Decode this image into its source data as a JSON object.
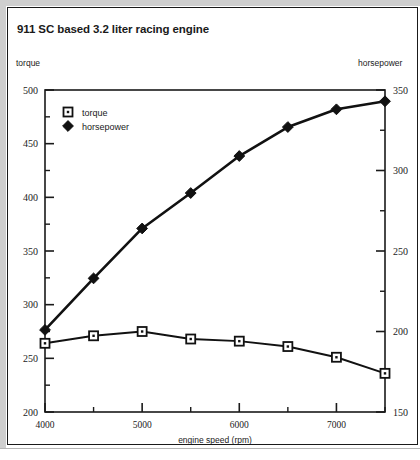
{
  "figure": {
    "title": "911 SC based 3.2 liter racing engine",
    "left_axis_caption": "torque",
    "right_axis_caption": "horsepower",
    "background": "#ffffff",
    "frame_color": "#1a1a1a",
    "line_color": "#111111"
  },
  "chart_data": {
    "type": "line",
    "title": "911 SC based 3.2 liter racing engine",
    "subtitle": "",
    "xlabel": "engine speed (rpm)",
    "ylabel": "torque",
    "y2label": "horsepower",
    "xlim": [
      4000,
      7500
    ],
    "ylim": [
      200,
      500
    ],
    "y2lim": [
      150,
      350
    ],
    "xticks": [
      4000,
      5000,
      6000,
      7000
    ],
    "xticklabels": [
      "4000",
      "5000",
      "6000",
      "7000"
    ],
    "xminorticks": [
      4500,
      5500,
      6500,
      7500
    ],
    "yticks": [
      200,
      250,
      300,
      350,
      400,
      450,
      500
    ],
    "yticklabels": [
      "200",
      "250",
      "300",
      "350",
      "400",
      "450",
      "500"
    ],
    "yminorticks": [
      225,
      275,
      325,
      375,
      425,
      475
    ],
    "y2ticks": [
      150,
      200,
      250,
      300,
      350
    ],
    "y2ticklabels": [
      "150",
      "200",
      "250",
      "300",
      "350"
    ],
    "y2minorticks": [
      175,
      225,
      275,
      325
    ],
    "grid": false,
    "legend_position": "upper left",
    "x": [
      4000,
      4500,
      5000,
      5500,
      6000,
      6500,
      7000,
      7500
    ],
    "series": [
      {
        "name": "torque",
        "axis": "left",
        "marker": "square-open",
        "values": [
          264,
          271,
          275,
          268,
          266,
          261,
          251,
          236
        ]
      },
      {
        "name": "horsepower",
        "axis": "right",
        "marker": "diamond-filled",
        "values": [
          201,
          233,
          264,
          286,
          309,
          327,
          338,
          343
        ]
      }
    ],
    "legend": [
      {
        "label": "torque",
        "marker": "square-open"
      },
      {
        "label": "horsepower",
        "marker": "diamond-filled"
      }
    ]
  }
}
